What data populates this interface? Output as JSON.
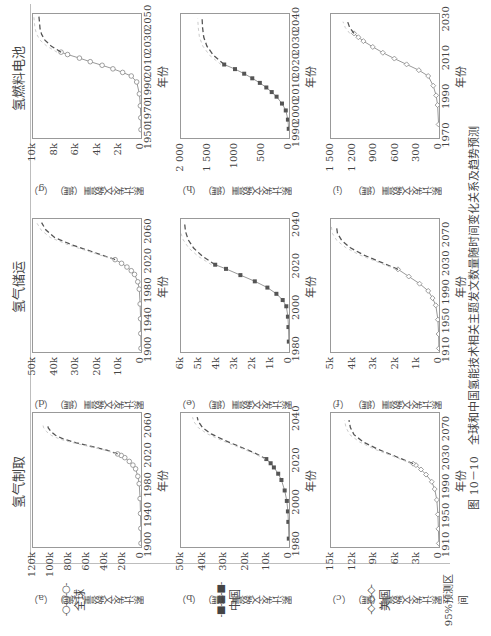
{
  "figure": {
    "caption": "图 10－10　全球和中国氢能技术相关主题发文数量随时间变化关系及趋势预测",
    "column_titles": [
      "氢气制取",
      "氢气储运",
      "氢燃料电池"
    ],
    "legend": [
      {
        "label": "全球",
        "symbol": "-○-○-○-",
        "style": "open-circle"
      },
      {
        "label": "中国",
        "symbol": "-■-■-■-",
        "style": "filled-square"
      },
      {
        "label": "美国",
        "symbol": "-◇-◇-◇-",
        "style": "open-diamond"
      },
      {
        "label": "95%预测区间",
        "symbol": "- - - -",
        "style": "dashed"
      }
    ],
    "xlabel": "年份",
    "ylabel": "累计发文数量（篇）"
  },
  "chart_data": [
    {
      "id": "a",
      "type": "line",
      "title": "氢气制取 - 全球",
      "panel_label": "（a）",
      "xlabel": "年份",
      "ylabel": "累计发文数量（篇）",
      "xticks": [
        "1900",
        "1940",
        "1980",
        "2020",
        "2060"
      ],
      "yticks": [
        "0",
        "20k",
        "40k",
        "60k",
        "80k",
        "100k",
        "120k"
      ],
      "xlim": [
        1895,
        2075
      ],
      "ylim": [
        0,
        120000
      ],
      "observed": {
        "x": [
          1900,
          1920,
          1940,
          1960,
          1980,
          1990,
          2000,
          2005,
          2010,
          2015,
          2018,
          2020
        ],
        "y": [
          0,
          200,
          500,
          1000,
          2000,
          3500,
          6000,
          9000,
          13000,
          18000,
          22000,
          26000
        ]
      },
      "forecast": {
        "x": [
          2020,
          2025,
          2030,
          2035,
          2040,
          2045,
          2050,
          2055,
          2060
        ],
        "y": [
          26000,
          38000,
          55000,
          72000,
          86000,
          95000,
          100000,
          103000,
          104000
        ]
      }
    },
    {
      "id": "b",
      "type": "line",
      "title": "氢气制取 - 中国",
      "panel_label": "（b）",
      "xlabel": "年份",
      "ylabel": "累计发文数量（篇）",
      "xticks": [
        "1980",
        "2000",
        "2020",
        "2040"
      ],
      "yticks": [
        "0",
        "10k",
        "20k",
        "30k",
        "40k",
        "50k"
      ],
      "xlim": [
        1978,
        2042
      ],
      "ylim": [
        0,
        50000
      ],
      "observed": {
        "x": [
          1982,
          1990,
          1995,
          2000,
          2005,
          2010,
          2013,
          2016,
          2018,
          2020
        ],
        "y": [
          100,
          300,
          500,
          1000,
          2000,
          3500,
          5000,
          7000,
          8500,
          10500
        ]
      },
      "forecast": {
        "x": [
          2020,
          2023,
          2026,
          2029,
          2032,
          2035,
          2038,
          2040
        ],
        "y": [
          10500,
          16000,
          23000,
          30000,
          36000,
          40000,
          42000,
          42500
        ]
      }
    },
    {
      "id": "c",
      "type": "line",
      "title": "氢气制取 - 美国",
      "panel_label": "（c）",
      "xlabel": "年份",
      "ylabel": "累计发文数量（篇）",
      "xticks": [
        "1910",
        "1950",
        "1990",
        "2030",
        "2070"
      ],
      "yticks": [
        "0",
        "3k",
        "6k",
        "9k",
        "12k",
        "15k"
      ],
      "xlim": [
        1905,
        2090
      ],
      "ylim": [
        0,
        15000
      ],
      "observed": {
        "x": [
          1910,
          1930,
          1950,
          1970,
          1985,
          1995,
          2005,
          2012,
          2018,
          2020
        ],
        "y": [
          20,
          80,
          150,
          300,
          600,
          1000,
          1800,
          2500,
          3200,
          3600
        ]
      },
      "forecast": {
        "x": [
          2020,
          2030,
          2040,
          2050,
          2060,
          2070,
          2080
        ],
        "y": [
          3600,
          6000,
          8500,
          10500,
          11800,
          12300,
          12500
        ]
      }
    },
    {
      "id": "d",
      "type": "line",
      "title": "氢气储运 - 全球",
      "panel_label": "（d）",
      "xlabel": "年份",
      "ylabel": "累计发文数量（篇）",
      "xticks": [
        "1900",
        "1940",
        "1980",
        "2020",
        "2060"
      ],
      "yticks": [
        "0",
        "10k",
        "20k",
        "30k",
        "40k",
        "50k"
      ],
      "xlim": [
        1895,
        2075
      ],
      "ylim": [
        0,
        50000
      ],
      "observed": {
        "x": [
          1900,
          1920,
          1940,
          1960,
          1980,
          1990,
          2000,
          2005,
          2010,
          2015,
          2020
        ],
        "y": [
          0,
          100,
          200,
          400,
          800,
          1500,
          3000,
          4500,
          6500,
          9000,
          12000
        ]
      },
      "forecast": {
        "x": [
          2020,
          2030,
          2040,
          2050,
          2060,
          2070
        ],
        "y": [
          12000,
          22000,
          32000,
          40000,
          44000,
          46000
        ]
      }
    },
    {
      "id": "e",
      "type": "line",
      "title": "氢气储运 - 中国",
      "panel_label": "（e）",
      "xlabel": "年份",
      "ylabel": "累计发文数量（篇）",
      "xticks": [
        "1980",
        "2000",
        "2020",
        "2040"
      ],
      "yticks": [
        "0",
        "1k",
        "2k",
        "3k",
        "4k",
        "5k",
        "6k"
      ],
      "xlim": [
        1978,
        2042
      ],
      "ylim": [
        0,
        6000
      ],
      "observed": {
        "x": [
          1983,
          1990,
          1995,
          2000,
          2003,
          2006,
          2009,
          2012,
          2015,
          2018,
          2020
        ],
        "y": [
          10,
          30,
          60,
          150,
          350,
          700,
          1200,
          1900,
          2700,
          3500,
          4100
        ]
      },
      "forecast": {
        "x": [
          2020,
          2024,
          2028,
          2032,
          2036,
          2040
        ],
        "y": [
          4100,
          4800,
          5300,
          5600,
          5750,
          5800
        ]
      }
    },
    {
      "id": "f",
      "type": "line",
      "title": "氢气储运 - 美国",
      "panel_label": "（f）",
      "xlabel": "年份",
      "ylabel": "累计发文数量（篇）",
      "xticks": [
        "1910",
        "1950",
        "1990",
        "2030",
        "2070"
      ],
      "yticks": [
        "0",
        "1k",
        "2k",
        "3k",
        "4k",
        "5k"
      ],
      "xlim": [
        1905,
        2090
      ],
      "ylim": [
        0,
        5000
      ],
      "observed": {
        "x": [
          1910,
          1930,
          1950,
          1970,
          1980,
          1990,
          2000,
          2010,
          2020
        ],
        "y": [
          5,
          20,
          50,
          150,
          300,
          500,
          900,
          1400,
          1900
        ]
      },
      "forecast": {
        "x": [
          2020,
          2030,
          2040,
          2050,
          2060,
          2070,
          2080
        ],
        "y": [
          1900,
          2700,
          3500,
          4100,
          4500,
          4700,
          4750
        ]
      }
    },
    {
      "id": "g",
      "type": "line",
      "title": "氢燃料电池 - 全球",
      "panel_label": "（g）",
      "xlabel": "年份",
      "ylabel": "累计发文数量（篇）",
      "xticks": [
        "1950",
        "1970",
        "1990",
        "2010",
        "2030",
        "2050"
      ],
      "yticks": [
        "0",
        "2k",
        "4k",
        "6k",
        "8k",
        "10k"
      ],
      "xlim": [
        1948,
        2052
      ],
      "ylim": [
        0,
        10000
      ],
      "observed": {
        "x": [
          1955,
          1965,
          1975,
          1985,
          1995,
          2000,
          2003,
          2006,
          2009,
          2012,
          2015,
          2018,
          2020
        ],
        "y": [
          0,
          20,
          60,
          150,
          400,
          900,
          1700,
          2600,
          3600,
          4700,
          5700,
          6800,
          7400
        ]
      },
      "forecast": {
        "x": [
          2020,
          2025,
          2030,
          2035,
          2040,
          2045,
          2050
        ],
        "y": [
          7400,
          8300,
          8900,
          9200,
          9350,
          9400,
          9450
        ]
      }
    },
    {
      "id": "h",
      "type": "line",
      "title": "氢燃料电池 - 中国",
      "panel_label": "（h）",
      "xlabel": "年份",
      "ylabel": "累计发文数量（篇）",
      "xticks": [
        "1990",
        "2000",
        "2010",
        "2020",
        "2030",
        "2040"
      ],
      "yticks": [
        "0",
        "500",
        "1000",
        "1 500",
        "2 000"
      ],
      "xlim": [
        1988,
        2042
      ],
      "ylim": [
        0,
        2000
      ],
      "observed": {
        "x": [
          1992,
          1996,
          2000,
          2003,
          2006,
          2008,
          2010,
          2012,
          2014,
          2016,
          2018,
          2020
        ],
        "y": [
          5,
          20,
          60,
          130,
          230,
          320,
          420,
          540,
          680,
          830,
          1000,
          1200
        ]
      },
      "forecast": {
        "x": [
          2020,
          2024,
          2028,
          2032,
          2036,
          2040
        ],
        "y": [
          1200,
          1400,
          1520,
          1580,
          1600,
          1610
        ]
      }
    },
    {
      "id": "i",
      "type": "line",
      "title": "氢燃料电池 - 美国",
      "panel_label": "（i）",
      "xlabel": "年份",
      "ylabel": "累计发文数量（篇）",
      "xticks": [
        "1970",
        "1990",
        "2010",
        "2030"
      ],
      "yticks": [
        "0",
        "300",
        "600",
        "900",
        "1 200",
        "1 500"
      ],
      "xlim": [
        1968,
        2032
      ],
      "ylim": [
        0,
        1500
      ],
      "observed": {
        "x": [
          1975,
          1985,
          1990,
          1995,
          2000,
          2003,
          2006,
          2009,
          2012,
          2015,
          2018,
          2020,
          2022
        ],
        "y": [
          5,
          20,
          40,
          80,
          150,
          280,
          450,
          620,
          780,
          920,
          1050,
          1120,
          1180
        ]
      },
      "forecast": {
        "x": [
          2022,
          2025,
          2028
        ],
        "y": [
          1180,
          1240,
          1270
        ]
      }
    }
  ]
}
